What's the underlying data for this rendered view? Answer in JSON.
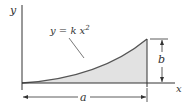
{
  "diagram": {
    "axes": {
      "x_label": "x",
      "y_label": "y"
    },
    "equation": {
      "lhs": "y = k x",
      "exponent": "2"
    },
    "dimensions": {
      "width_label": "a",
      "height_label": "b"
    },
    "colors": {
      "fill": "#e2e2e2",
      "stroke": "#333333",
      "curve": "#555555"
    }
  }
}
